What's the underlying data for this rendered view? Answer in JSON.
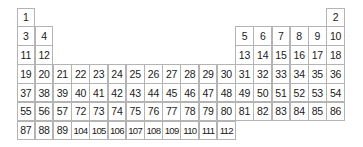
{
  "diagram": {
    "type": "grid",
    "columns": 18,
    "rows": 7,
    "colors": {
      "border": "#b4b4b4",
      "text": "#1a1a1a",
      "background": "#ffffff"
    },
    "grid": [
      [
        "1",
        "",
        "",
        "",
        "",
        "",
        "",
        "",
        "",
        "",
        "",
        "",
        "",
        "",
        "",
        "",
        "",
        "2"
      ],
      [
        "3",
        "4",
        "",
        "",
        "",
        "",
        "",
        "",
        "",
        "",
        "",
        "",
        "5",
        "6",
        "7",
        "8",
        "9",
        "10"
      ],
      [
        "11",
        "12",
        "",
        "",
        "",
        "",
        "",
        "",
        "",
        "",
        "",
        "",
        "13",
        "14",
        "15",
        "16",
        "17",
        "18"
      ],
      [
        "19",
        "20",
        "21",
        "22",
        "23",
        "24",
        "25",
        "26",
        "27",
        "28",
        "29",
        "30",
        "31",
        "32",
        "33",
        "34",
        "35",
        "36"
      ],
      [
        "37",
        "38",
        "39",
        "40",
        "41",
        "42",
        "43",
        "44",
        "45",
        "46",
        "47",
        "48",
        "49",
        "50",
        "51",
        "52",
        "53",
        "54"
      ],
      [
        "55",
        "56",
        "57",
        "72",
        "73",
        "74",
        "75",
        "76",
        "77",
        "78",
        "79",
        "80",
        "81",
        "82",
        "83",
        "84",
        "85",
        "86"
      ],
      [
        "87",
        "88",
        "89",
        "104",
        "105",
        "106",
        "107",
        "108",
        "109",
        "110",
        "111",
        "112",
        "",
        "",
        "",
        "",
        "",
        ""
      ]
    ]
  }
}
